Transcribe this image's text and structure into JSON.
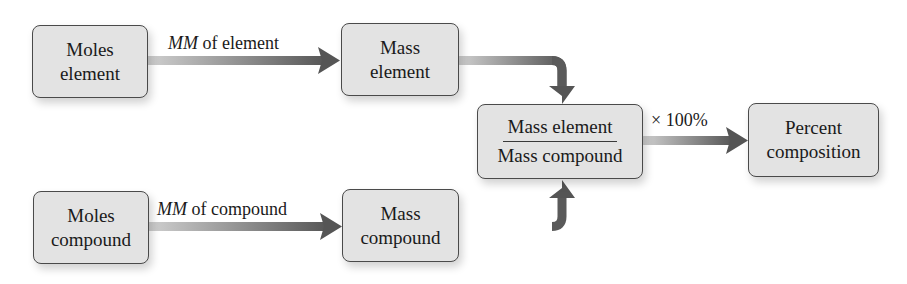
{
  "nodes": {
    "moles_element": {
      "line1": "Moles",
      "line2": "element"
    },
    "mass_element": {
      "line1": "Mass",
      "line2": "element"
    },
    "ratio": {
      "numerator": "Mass element",
      "denominator": "Mass compound"
    },
    "percent_composition": {
      "line1": "Percent",
      "line2": "composition"
    },
    "moles_compound": {
      "line1": "Moles",
      "line2": "compound"
    },
    "mass_compound": {
      "line1": "Mass",
      "line2": "compound"
    }
  },
  "edges": {
    "element_conversion": {
      "italic": "MM",
      "rest": " of element"
    },
    "compound_conversion": {
      "italic": "MM",
      "rest": " of compound"
    },
    "percent_conversion": {
      "label": "× 100%"
    }
  },
  "colors": {
    "box_fill": "#e3e3e3",
    "box_border": "#4a4a4a",
    "arrow_light": "#c8c8c8",
    "arrow_dark": "#555555"
  }
}
